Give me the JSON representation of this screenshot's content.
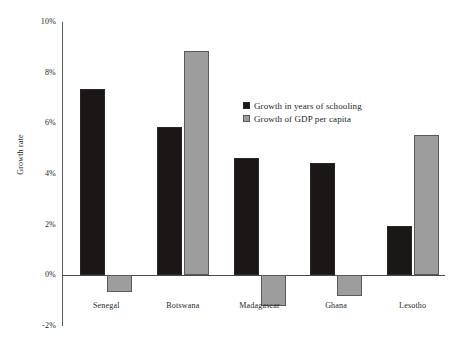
{
  "chart_data": {
    "type": "bar",
    "title": "",
    "subtitle": "",
    "xlabel": "",
    "ylabel": "Growth rate",
    "categories": [
      "Senegal",
      "Botswana",
      "Madagascar",
      "Ghana",
      "Lesotho"
    ],
    "series": [
      {
        "name": "Growth in years of schooling",
        "color": "#1b1717",
        "values": [
          7.35,
          5.85,
          4.65,
          4.45,
          1.95
        ]
      },
      {
        "name": "Growth of GDP per capita",
        "color": "#9d9d9d",
        "values": [
          -0.65,
          8.85,
          -1.2,
          -0.8,
          5.55
        ]
      }
    ],
    "ylim": [
      -2,
      10
    ],
    "y_ticks": [
      "10%",
      "8%",
      "6%",
      "4%",
      "2%",
      "0%",
      "-2%"
    ],
    "y_tick_values": [
      10,
      8,
      6,
      4,
      2,
      0,
      -2
    ],
    "grid": false,
    "legend_position": "center-right",
    "value_suffix": "%"
  }
}
